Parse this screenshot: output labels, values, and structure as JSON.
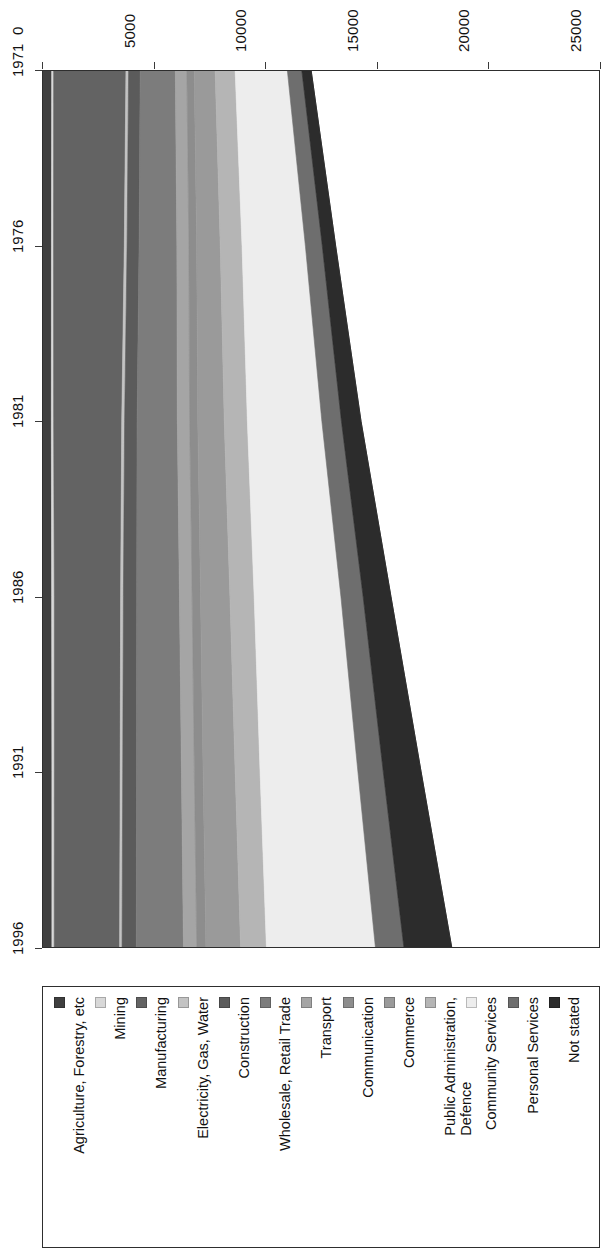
{
  "chart_data": {
    "type": "area",
    "title": "",
    "subtitle": "",
    "xlabel": "",
    "ylabel": "",
    "orientation": "rotated-90",
    "stacked": true,
    "grid": false,
    "legend_position": "bottom",
    "categories": [
      "1971",
      "1976",
      "1981",
      "1986",
      "1991",
      "1996"
    ],
    "x": [
      1971,
      1976,
      1981,
      1986,
      1991,
      1996
    ],
    "value_axis_ticks": [
      "0",
      "5000",
      "10000",
      "15000",
      "20000",
      "25000"
    ],
    "value_axis_tick_values": [
      0,
      5000,
      10000,
      15000,
      20000,
      25000
    ],
    "ylim": [
      0,
      25000
    ],
    "series": [
      {
        "name": "Agriculture, Forestry, etc",
        "color": "#3f3f3f",
        "values": [
          390,
          380,
          375,
          390,
          400,
          400
        ]
      },
      {
        "name": "Mining",
        "color": "#d8d8d8",
        "values": [
          90,
          95,
          105,
          120,
          110,
          105
        ]
      },
      {
        "name": "Manufacturing",
        "color": "#636363",
        "values": [
          3250,
          3180,
          3060,
          2980,
          2960,
          2940
        ]
      },
      {
        "name": "Electricity, Gas, Water",
        "color": "#c3c3c3",
        "values": [
          120,
          125,
          130,
          125,
          115,
          110
        ]
      },
      {
        "name": "Construction",
        "color": "#5b5b5b",
        "values": [
          520,
          540,
          560,
          600,
          620,
          640
        ]
      },
      {
        "name": "Wholesale, Retail Trade",
        "color": "#7c7c7c",
        "values": [
          1580,
          1700,
          1810,
          1920,
          2020,
          2120
        ]
      },
      {
        "name": "Transport",
        "color": "#a5a5a5",
        "values": [
          520,
          540,
          555,
          570,
          580,
          600
        ]
      },
      {
        "name": "Communication",
        "color": "#8d8d8d",
        "values": [
          330,
          350,
          365,
          380,
          395,
          410
        ]
      },
      {
        "name": "Commerce",
        "color": "#9a9a9a",
        "values": [
          940,
          1060,
          1190,
          1320,
          1440,
          1560
        ]
      },
      {
        "name": "Public Administration, Defence",
        "color": "#b5b5b5",
        "values": [
          900,
          980,
          1040,
          1090,
          1120,
          1160
        ]
      },
      {
        "name": "Community Services",
        "color": "#ededed",
        "values": [
          2350,
          2850,
          3350,
          3900,
          4400,
          4900
        ]
      },
      {
        "name": "Personal Services",
        "color": "#6e6e6e",
        "values": [
          650,
          760,
          880,
          1000,
          1140,
          1280
        ]
      },
      {
        "name": "Not stated",
        "color": "#2c2c2c",
        "values": [
          420,
          600,
          880,
          1250,
          1700,
          2150
        ]
      }
    ],
    "totals": [
      12060,
      13660,
      15300,
      16645,
      19000,
      18375
    ]
  },
  "value_axis": {
    "name": "value-axis",
    "ticks": [
      {
        "label": "0",
        "value": 0
      },
      {
        "label": "5000",
        "value": 5000
      },
      {
        "label": "10000",
        "value": 10000
      },
      {
        "label": "15000",
        "value": 15000
      },
      {
        "label": "20000",
        "value": 20000
      },
      {
        "label": "25000",
        "value": 25000
      }
    ]
  },
  "category_axis": {
    "name": "year-axis",
    "ticks": [
      {
        "label": "1971"
      },
      {
        "label": "1976"
      },
      {
        "label": "1981"
      },
      {
        "label": "1986"
      },
      {
        "label": "1991"
      },
      {
        "label": "1996"
      }
    ]
  },
  "legend": {
    "entries": [
      {
        "label": "Not stated",
        "color": "#2c2c2c"
      },
      {
        "label": "Personal Services",
        "color": "#6e6e6e"
      },
      {
        "label": "Community Services",
        "color": "#ededed"
      },
      {
        "label": "Public Administration,\nDefence",
        "color": "#b5b5b5"
      },
      {
        "label": "Commerce",
        "color": "#9a9a9a"
      },
      {
        "label": "Communication",
        "color": "#8d8d8d"
      },
      {
        "label": "Transport",
        "color": "#a5a5a5"
      },
      {
        "label": "Wholesale, Retail Trade",
        "color": "#7c7c7c"
      },
      {
        "label": "Construction",
        "color": "#5b5b5b"
      },
      {
        "label": "Electricity, Gas, Water",
        "color": "#c3c3c3"
      },
      {
        "label": "Manufacturing",
        "color": "#636363"
      },
      {
        "label": "Mining",
        "color": "#d8d8d8"
      },
      {
        "label": "Agriculture, Forestry, etc",
        "color": "#3f3f3f"
      }
    ]
  }
}
